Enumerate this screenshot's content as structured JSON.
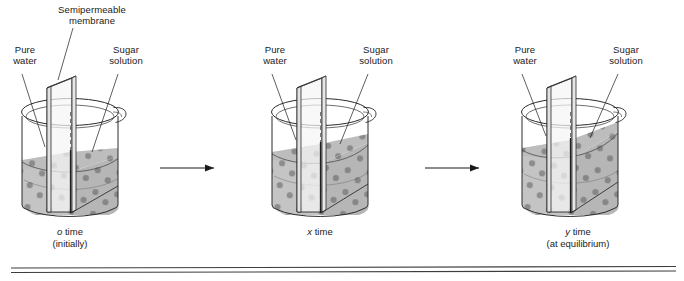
{
  "figure": {
    "type": "osmosis-diagram",
    "title_visible": false,
    "stages": [
      {
        "id": "stage-o",
        "labels": {
          "membrane": "Semipermeable\nmembrane",
          "membrane_line1": "Semipermeable",
          "membrane_line2": "membrane",
          "pure_water_line1": "Pure",
          "pure_water_line2": "water",
          "sugar_line1": "Sugar",
          "sugar_line2": "solution"
        },
        "caption_line1_italic": "o",
        "caption_line1_rest": " time",
        "caption_line2": "(initially)",
        "water_level_pct": 42,
        "sugar_level_pct": 42
      },
      {
        "id": "stage-x",
        "labels": {
          "pure_water_line1": "Pure",
          "pure_water_line2": "water",
          "sugar_line1": "Sugar",
          "sugar_line2": "solution"
        },
        "caption_line1_italic": "x",
        "caption_line1_rest": " time",
        "caption_line2": "",
        "water_level_pct": 50,
        "sugar_level_pct": 58
      },
      {
        "id": "stage-y",
        "labels": {
          "pure_water_line1": "Pure",
          "pure_water_line2": "water",
          "sugar_line1": "Sugar",
          "sugar_line2": "solution"
        },
        "caption_line1_italic": "y",
        "caption_line1_rest": " time",
        "caption_line2": "(at equilibrium)",
        "water_level_pct": 55,
        "sugar_level_pct": 70
      }
    ],
    "arrows": [
      {
        "id": "arrow-1",
        "name": "process-arrow-right"
      },
      {
        "id": "arrow-2",
        "name": "process-arrow-right"
      }
    ],
    "colors": {
      "outline": "#1a1a1a",
      "glass": "#4a4a4a",
      "liquid": "#c3c3c3",
      "liquid_dark": "#b0b0b0",
      "dot": "#8d8d8d",
      "membrane_face": "#f2f2f2",
      "rule": "#555555",
      "background": "#ffffff"
    },
    "footer_rule": {
      "name": "double-horizontal-rule",
      "visible": true
    }
  }
}
